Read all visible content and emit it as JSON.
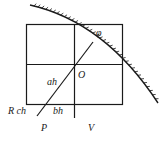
{
  "diagram": {
    "labels": {
      "phi": "φ",
      "origin": "O",
      "ah": "ah",
      "rch": "R ch",
      "bh": "bh",
      "p": "P",
      "v": "V"
    },
    "colors": {
      "line": "#1a1a1a",
      "background": "#ffffff"
    }
  }
}
